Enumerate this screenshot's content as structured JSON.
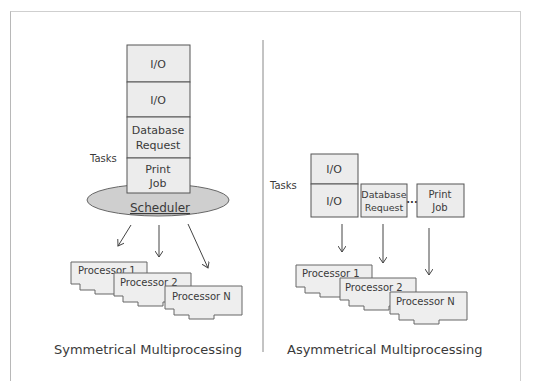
{
  "diagram": {
    "left_panel": {
      "title": "Symmetrical Multiprocessing",
      "tasks_label": "Tasks",
      "task_stack": [
        {
          "line1": "I/O",
          "line2": ""
        },
        {
          "line1": "I/O",
          "line2": ""
        },
        {
          "line1": "Database",
          "line2": "Request"
        },
        {
          "line1": "Print",
          "line2": "Job"
        }
      ],
      "scheduler_label": "Scheduler",
      "processors": [
        "Processor 1",
        "Processor 2",
        "Processor N"
      ]
    },
    "right_panel": {
      "title": "Asymmetrical Multiprocessing",
      "tasks_label": "Tasks",
      "io_stack": [
        "I/O",
        "I/O"
      ],
      "db_task": {
        "line1": "Database",
        "line2": "Request"
      },
      "ellipsis": "...",
      "print_task": {
        "line1": "Print",
        "line2": "Job"
      },
      "processors": [
        "Processor 1",
        "Processor 2",
        "Processor N"
      ]
    },
    "colors": {
      "box_fill": "#ececec",
      "scheduler_fill": "#cfcfcf",
      "stroke": "#555555"
    }
  }
}
